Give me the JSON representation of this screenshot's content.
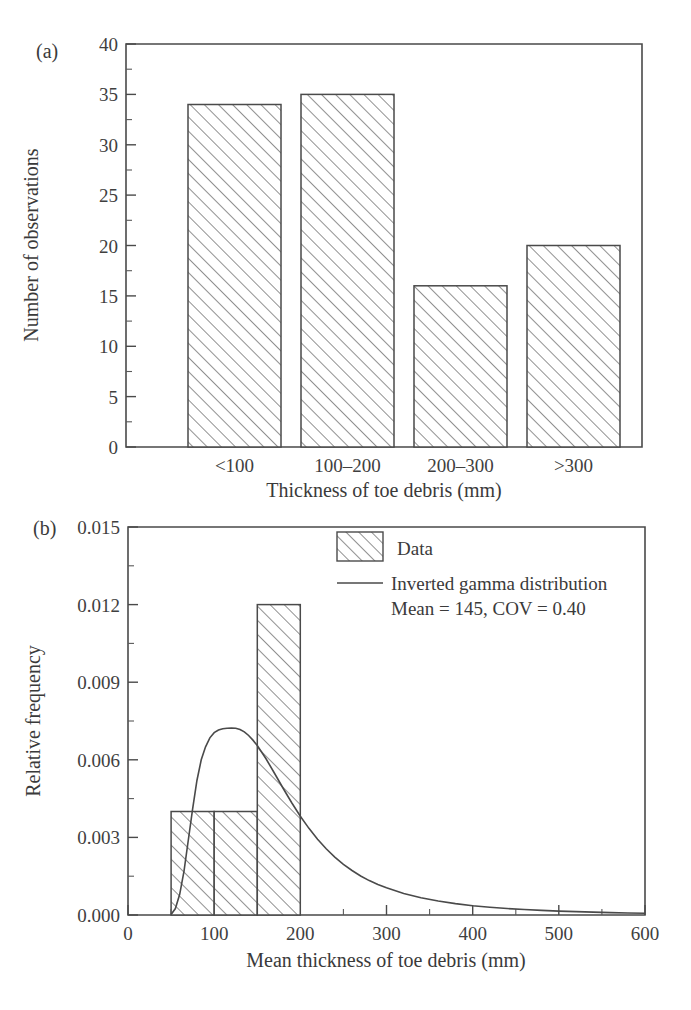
{
  "figure": {
    "panel_a_label": "(a)",
    "panel_b_label": "(b)"
  },
  "chart_data": [
    {
      "type": "bar",
      "panel": "(a)",
      "title": "",
      "categories": [
        "<100",
        "100–200",
        "200–300",
        ">300"
      ],
      "values": [
        34,
        35,
        16,
        20
      ],
      "xlabel": "Thickness of toe debris (mm)",
      "ylabel": "Number of observations",
      "ylim": [
        0,
        40
      ],
      "yticks": [
        0,
        5,
        10,
        15,
        20,
        25,
        30,
        35,
        40
      ],
      "ytick_labels": [
        "0",
        "5",
        "10",
        "15",
        "20",
        "25",
        "30",
        "35",
        "40"
      ],
      "y_minor_step": 2.5,
      "grid": false,
      "legend": false,
      "bar_fill": "hatched-45",
      "frame_color": "#4a4a4a"
    },
    {
      "type": "bar",
      "panel": "(b)",
      "title": "",
      "xlabel": "Mean thickness of toe debris (mm)",
      "ylabel": "Relative frequency",
      "xlim": [
        0,
        600
      ],
      "ylim": [
        0.0,
        0.015
      ],
      "xticks": [
        0,
        100,
        200,
        300,
        400,
        500,
        600
      ],
      "xtick_labels": [
        "0",
        "100",
        "200",
        "300",
        "400",
        "500",
        "600"
      ],
      "x_minor_step": 50,
      "yticks": [
        0.0,
        0.003,
        0.006,
        0.009,
        0.012,
        0.015
      ],
      "ytick_labels": [
        "0.000",
        "0.003",
        "0.006",
        "0.009",
        "0.012",
        "0.015"
      ],
      "y_minor_step": 0.0015,
      "grid": false,
      "bins": [
        {
          "x0": 50,
          "x1": 100,
          "value": 0.004
        },
        {
          "x0": 100,
          "x1": 150,
          "value": 0.004
        },
        {
          "x0": 150,
          "x1": 200,
          "value": 0.012
        }
      ],
      "series": [
        {
          "name": "Inverted gamma distribution",
          "type": "line",
          "mean": 145,
          "cov": 0.4,
          "points": [
            [
              50,
              2e-05
            ],
            [
              55,
              0.00025
            ],
            [
              60,
              0.0008
            ],
            [
              65,
              0.0017
            ],
            [
              70,
              0.0029
            ],
            [
              75,
              0.0041
            ],
            [
              80,
              0.0052
            ],
            [
              85,
              0.006
            ],
            [
              90,
              0.0065
            ],
            [
              95,
              0.00685
            ],
            [
              100,
              0.00705
            ],
            [
              105,
              0.00715
            ],
            [
              110,
              0.0072
            ],
            [
              115,
              0.00722
            ],
            [
              120,
              0.00723
            ],
            [
              125,
              0.00722
            ],
            [
              130,
              0.00717
            ],
            [
              135,
              0.00708
            ],
            [
              140,
              0.00694
            ],
            [
              145,
              0.00676
            ],
            [
              150,
              0.00655
            ],
            [
              160,
              0.00605
            ],
            [
              170,
              0.00548
            ],
            [
              180,
              0.0049
            ],
            [
              190,
              0.00434
            ],
            [
              200,
              0.00382
            ],
            [
              210,
              0.00335
            ],
            [
              220,
              0.00293
            ],
            [
              230,
              0.00256
            ],
            [
              240,
              0.00224
            ],
            [
              250,
              0.00196
            ],
            [
              260,
              0.00172
            ],
            [
              270,
              0.00151
            ],
            [
              280,
              0.00133
            ],
            [
              290,
              0.00118
            ],
            [
              300,
              0.00105
            ],
            [
              320,
              0.00083
            ],
            [
              340,
              0.00067
            ],
            [
              360,
              0.00054
            ],
            [
              380,
              0.00044
            ],
            [
              400,
              0.00036
            ],
            [
              420,
              0.0003
            ],
            [
              440,
              0.00025
            ],
            [
              460,
              0.00021
            ],
            [
              480,
              0.00018
            ],
            [
              500,
              0.00015
            ],
            [
              520,
              0.00013
            ],
            [
              540,
              0.00011
            ],
            [
              560,
              9e-05
            ],
            [
              580,
              8e-05
            ],
            [
              600,
              7e-05
            ]
          ]
        }
      ],
      "legend": {
        "position": "top-right",
        "entries": [
          {
            "label": "Data",
            "marker": "hatched-swatch"
          },
          {
            "label": "Inverted gamma distribution",
            "marker": "line"
          },
          {
            "label": "Mean = 145, COV = 0.40",
            "marker": "none"
          }
        ]
      },
      "bar_fill": "hatched-45",
      "frame_color": "#4a4a4a"
    }
  ]
}
